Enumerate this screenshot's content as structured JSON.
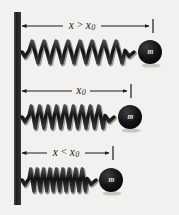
{
  "figure": {
    "background_color": "#f2f1ef",
    "ink_color": "#1b1b1b",
    "mass_color": "#131313",
    "mass_label_color": "#e8e6e2",
    "wall": {
      "name": "fixed-wall",
      "x": 14,
      "y": 12,
      "width": 7,
      "height": 193,
      "color": "#262626"
    },
    "rows": [
      {
        "id": "stretched",
        "dimension_label": {
          "variable": "x",
          "relation": ">",
          "reference": "x",
          "reference_subscript": "0",
          "full_text": "x > x0"
        },
        "dimension_line": {
          "y": 26,
          "x_start": 22,
          "x_end": 150
        },
        "label_center_x": 82,
        "spring": {
          "y": 52,
          "x_start": 22,
          "x_end": 134,
          "coils": 8,
          "amplitude": 11,
          "state": "stretched"
        },
        "mass": {
          "cx": 150,
          "cy": 52,
          "r": 12,
          "label": "m"
        }
      },
      {
        "id": "natural",
        "dimension_label": {
          "variable": "x",
          "relation": "",
          "reference": "x",
          "reference_subscript": "0",
          "full_text": "x0"
        },
        "dimension_line": {
          "y": 91,
          "x_start": 22,
          "x_end": 128
        },
        "label_center_x": 81,
        "spring": {
          "y": 117,
          "x_start": 22,
          "x_end": 114,
          "coils": 9,
          "amplitude": 11,
          "state": "natural"
        },
        "mass": {
          "cx": 130,
          "cy": 117,
          "r": 12,
          "label": "m"
        }
      },
      {
        "id": "compressed",
        "dimension_label": {
          "variable": "x",
          "relation": "<",
          "reference": "x",
          "reference_subscript": "0",
          "full_text": "x < x0"
        },
        "dimension_line": {
          "y": 153,
          "x_start": 22,
          "x_end": 110
        },
        "label_center_x": 66,
        "spring": {
          "y": 180,
          "x_start": 22,
          "x_end": 96,
          "coils": 9,
          "amplitude": 11,
          "state": "compressed"
        },
        "mass": {
          "cx": 111,
          "cy": 180,
          "r": 12,
          "label": "m"
        }
      }
    ]
  }
}
